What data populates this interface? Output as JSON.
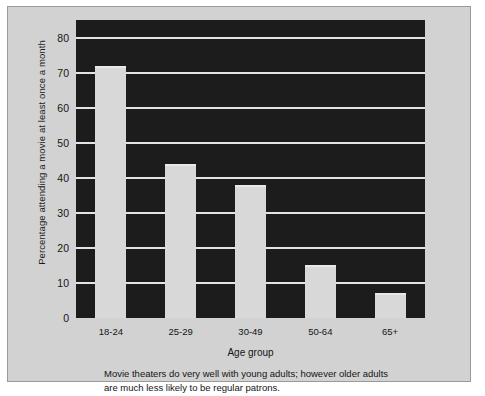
{
  "chart_data": {
    "type": "bar",
    "title": "",
    "subtitle": "",
    "xlabel": "Age group",
    "ylabel": "Percentage attending a movie at least once a month",
    "categories": [
      "18-24",
      "25-29",
      "30-49",
      "50-64",
      "65+"
    ],
    "values": [
      72,
      44,
      38,
      15,
      7
    ],
    "series": [
      {
        "name": "Percentage attending a movie at least once a month",
        "values": [
          72,
          44,
          38,
          15,
          7
        ]
      }
    ],
    "ylim": [
      0,
      85
    ],
    "yticks": [
      0,
      10,
      20,
      30,
      40,
      50,
      60,
      70,
      80
    ],
    "ytick_labels": [
      "0",
      "10",
      "20",
      "30",
      "40",
      "50",
      "60",
      "70",
      "80"
    ],
    "grid": true,
    "grid_axis": "y",
    "legend": false,
    "legend_position": "none",
    "colors": {
      "figure_background": "#d2d2d2",
      "plot_background": "#1c1c1c",
      "bar_fill": "#d8d8d8",
      "gridline": "#e3e3e3",
      "text": "#141414",
      "border": "#9a9a9a"
    }
  },
  "caption": {
    "text": "Movie theaters do very well with young adults; however older adults are much less likely to be regular patrons."
  }
}
